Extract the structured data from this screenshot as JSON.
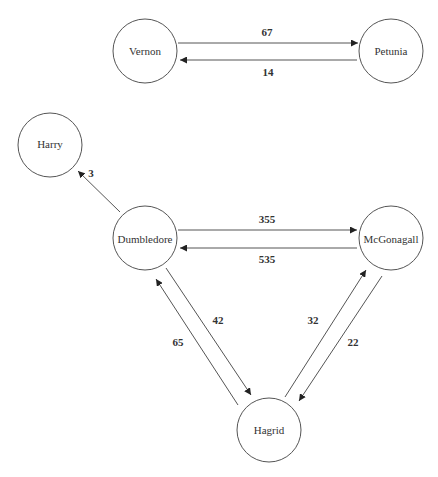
{
  "diagram": {
    "type": "directed-graph",
    "nodes": [
      {
        "id": "vernon",
        "label": "Vernon",
        "cx": 145,
        "cy": 51,
        "r": 32
      },
      {
        "id": "petunia",
        "label": "Petunia",
        "cx": 391,
        "cy": 51,
        "r": 32
      },
      {
        "id": "harry",
        "label": "Harry",
        "cx": 50,
        "cy": 145,
        "r": 32
      },
      {
        "id": "dumbledore",
        "label": "Dumbledore",
        "cx": 145,
        "cy": 238,
        "r": 32
      },
      {
        "id": "mcgonagall",
        "label": "McGonagall",
        "cx": 391,
        "cy": 238,
        "r": 32
      },
      {
        "id": "hagrid",
        "label": "Hagrid",
        "cx": 269,
        "cy": 430,
        "r": 32
      }
    ],
    "edges": [
      {
        "from": "vernon",
        "to": "petunia",
        "weight": "67"
      },
      {
        "from": "petunia",
        "to": "vernon",
        "weight": "14"
      },
      {
        "from": "dumbledore",
        "to": "harry",
        "weight": "3"
      },
      {
        "from": "dumbledore",
        "to": "mcgonagall",
        "weight": "355"
      },
      {
        "from": "mcgonagall",
        "to": "dumbledore",
        "weight": "535"
      },
      {
        "from": "dumbledore",
        "to": "hagrid",
        "weight": "42"
      },
      {
        "from": "hagrid",
        "to": "dumbledore",
        "weight": "65"
      },
      {
        "from": "hagrid",
        "to": "mcgonagall",
        "weight": "32"
      },
      {
        "from": "mcgonagall",
        "to": "hagrid",
        "weight": "22"
      }
    ]
  }
}
